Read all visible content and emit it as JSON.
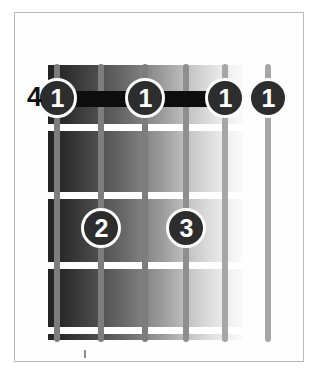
{
  "diagram": {
    "type": "guitar-chord-diagram",
    "instrument": "guitar",
    "string_count": 6,
    "fret_count": 4,
    "starting_fret_label": "4",
    "barre": {
      "finger": "1",
      "from_string": 1,
      "to_string": 5,
      "fret": 1,
      "color": "#0d0d0d"
    },
    "finger_dots": [
      {
        "label": "1",
        "string": 1,
        "fret": 1,
        "x": 37,
        "y": 78
      },
      {
        "label": "1",
        "string": 3,
        "fret": 1,
        "x": 125,
        "y": 78
      },
      {
        "label": "1",
        "string": 5,
        "fret": 1,
        "x": 205,
        "y": 78
      },
      {
        "label": "1",
        "string": 6,
        "fret": 1,
        "x": 248,
        "y": 78
      },
      {
        "label": "2",
        "string": 2,
        "fret": 3,
        "x": 81,
        "y": 208
      },
      {
        "label": "3",
        "string": 4,
        "fret": 3,
        "x": 166,
        "y": 208
      }
    ],
    "fret_lines": [
      {
        "y": 124
      },
      {
        "y": 192
      },
      {
        "y": 262
      },
      {
        "y": 327
      }
    ],
    "strings": [
      {
        "index": 1,
        "x": 54,
        "top": 64,
        "height": 278,
        "shade": "dark"
      },
      {
        "index": 2,
        "x": 98,
        "top": 64,
        "height": 278,
        "shade": "dark"
      },
      {
        "index": 3,
        "x": 142,
        "top": 64,
        "height": 278,
        "shade": "dark"
      },
      {
        "index": 4,
        "x": 183,
        "top": 64,
        "height": 278,
        "shade": ""
      },
      {
        "index": 5,
        "x": 222,
        "top": 64,
        "height": 278,
        "shade": "light"
      },
      {
        "index": 6,
        "x": 265,
        "top": 64,
        "height": 278,
        "shade": "light"
      }
    ],
    "colors": {
      "frame_border": "#b9b9b9",
      "page_background": "#ffffff",
      "fret_line": "#ffffff",
      "string": "#8e8e8e",
      "dot_fill": "#2d2d2d",
      "dot_ring": "#fbfbfb",
      "dot_text": "#ffffff",
      "fret_label_text": "#111111"
    }
  }
}
